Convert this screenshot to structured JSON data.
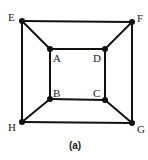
{
  "diagram": {
    "caption": "(a)",
    "nodes": [
      {
        "id": "E",
        "label": "E",
        "x": 22,
        "y": 21,
        "lx": 8,
        "ly": 21
      },
      {
        "id": "F",
        "label": "F",
        "x": 132,
        "y": 22,
        "lx": 137,
        "ly": 22
      },
      {
        "id": "G",
        "label": "G",
        "x": 132,
        "y": 123,
        "lx": 137,
        "ly": 133
      },
      {
        "id": "H",
        "label": "H",
        "x": 22,
        "y": 122,
        "lx": 8,
        "ly": 131
      },
      {
        "id": "A",
        "label": "A",
        "x": 50,
        "y": 49,
        "lx": 53,
        "ly": 62
      },
      {
        "id": "D",
        "label": "D",
        "x": 105,
        "y": 49,
        "lx": 93,
        "ly": 62
      },
      {
        "id": "C",
        "label": "C",
        "x": 105,
        "y": 100,
        "lx": 93,
        "ly": 97
      },
      {
        "id": "B",
        "label": "B",
        "x": 50,
        "y": 99,
        "lx": 53,
        "ly": 97
      }
    ],
    "edges": [
      [
        "E",
        "F"
      ],
      [
        "F",
        "G"
      ],
      [
        "G",
        "H"
      ],
      [
        "H",
        "E"
      ],
      [
        "A",
        "D"
      ],
      [
        "D",
        "C"
      ],
      [
        "C",
        "B"
      ],
      [
        "B",
        "A"
      ],
      [
        "E",
        "A"
      ],
      [
        "F",
        "D"
      ],
      [
        "G",
        "C"
      ],
      [
        "H",
        "B"
      ]
    ],
    "colors": {
      "edge": "#111111",
      "node": "#111111"
    }
  }
}
